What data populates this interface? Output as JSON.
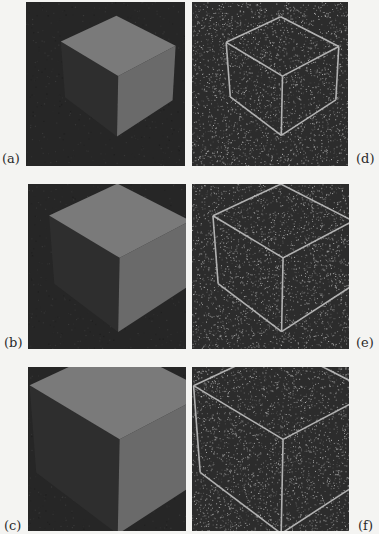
{
  "figure": {
    "colors": {
      "page_background": "#f4f4f2",
      "shaded_background": "#262626",
      "edge_background": "#2c2c2c",
      "cube_top": "#7a7a7a",
      "cube_left": "#2e2e2e",
      "cube_right": "#6a6a6a",
      "edge_line": "#bdbdbd",
      "noise_light": "#9a9a9a"
    },
    "panels": [
      {
        "id": "a",
        "label": "(a)",
        "kind": "shaded-cube",
        "cube_scale": 0.38
      },
      {
        "id": "b",
        "label": "(b)",
        "kind": "shaded-cube",
        "cube_scale": 0.47
      },
      {
        "id": "c",
        "label": "(c)",
        "kind": "shaded-cube",
        "cube_scale": 0.6
      },
      {
        "id": "d",
        "label": "(d)",
        "kind": "edge-cube",
        "cube_scale": 0.38
      },
      {
        "id": "e",
        "label": "(e)",
        "kind": "edge-cube",
        "cube_scale": 0.47
      },
      {
        "id": "f",
        "label": "(f)",
        "kind": "edge-cube",
        "cube_scale": 0.6
      }
    ]
  }
}
